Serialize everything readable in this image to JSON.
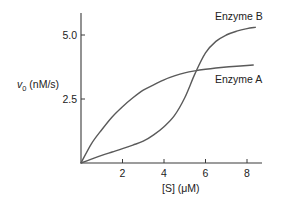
{
  "chart_data": {
    "type": "line",
    "title": "",
    "xlabel": "[S] (μM)",
    "ylabel_main": "v",
    "ylabel_sub": "0",
    "ylabel_rest": " (nM/s)",
    "ylabel": "v0 (nM/s)",
    "xlim": [
      0,
      8.7
    ],
    "ylim": [
      0,
      5.8
    ],
    "xticks": [
      2,
      4,
      6,
      8
    ],
    "xtick_labels": [
      "2",
      "4",
      "6",
      "8"
    ],
    "yticks": [
      2.5,
      5.0
    ],
    "ytick_labels": [
      "2.5",
      "5.0"
    ],
    "grid": false,
    "legend": "inline labels near curve ends",
    "series": [
      {
        "name": "Enzyme A",
        "shape": "hyperbolic",
        "color": "#5a5a5a",
        "x": [
          0,
          0.5,
          1,
          1.5,
          2,
          2.5,
          3,
          3.5,
          4,
          4.5,
          5,
          5.5,
          6,
          6.5,
          7,
          7.5,
          8,
          8.3
        ],
        "y": [
          0,
          0.75,
          1.3,
          1.8,
          2.2,
          2.55,
          2.85,
          3.05,
          3.25,
          3.4,
          3.52,
          3.6,
          3.66,
          3.71,
          3.75,
          3.78,
          3.81,
          3.83
        ]
      },
      {
        "name": "Enzyme B",
        "shape": "sigmoidal",
        "color": "#5a5a5a",
        "x": [
          0,
          0.5,
          1,
          1.5,
          2,
          2.5,
          3,
          3.5,
          4,
          4.5,
          5,
          5.5,
          6,
          6.5,
          7,
          7.5,
          8,
          8.4
        ],
        "y": [
          0,
          0.15,
          0.3,
          0.43,
          0.56,
          0.7,
          0.85,
          1.1,
          1.42,
          1.85,
          2.55,
          3.5,
          4.3,
          4.75,
          5.0,
          5.15,
          5.25,
          5.3
        ]
      }
    ]
  },
  "labels": {
    "series_a": "Enzyme A",
    "series_b": "Enzyme B",
    "x_axis_title": "[S] (μM)",
    "y_axis_main": "v",
    "y_axis_sub": "0",
    "y_axis_rest": " (nM/s)"
  }
}
